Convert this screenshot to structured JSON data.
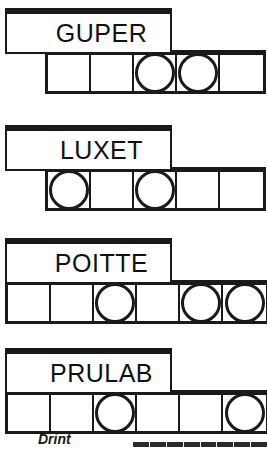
{
  "page": {
    "background_color": "#ffffff",
    "ink_color": "#1a1a1a",
    "width": 267,
    "height": 452
  },
  "puzzles": [
    {
      "id": "puzzle-guper",
      "label": "GUPER",
      "label_box": {
        "x": 5,
        "y": 8,
        "width": 167,
        "height": 46
      },
      "grid": {
        "x": 45,
        "y": 50,
        "cells": 5,
        "cell_width": 43,
        "height": 44
      },
      "circle_cells": [
        3,
        4
      ]
    },
    {
      "id": "puzzle-luxet",
      "label": "LUXET",
      "label_box": {
        "x": 5,
        "y": 125,
        "width": 167,
        "height": 46
      },
      "grid": {
        "x": 45,
        "y": 167,
        "cells": 5,
        "cell_width": 43,
        "height": 44
      },
      "circle_cells": [
        1,
        3
      ]
    },
    {
      "id": "puzzle-poitte",
      "label": "POITTE",
      "label_box": {
        "x": 5,
        "y": 238,
        "width": 167,
        "height": 46
      },
      "grid": {
        "x": 5,
        "y": 280,
        "cells": 6,
        "cell_width": 43,
        "height": 44
      },
      "circle_cells": [
        3,
        5,
        6
      ]
    },
    {
      "id": "puzzle-prulab",
      "label": "PRULAB",
      "label_box": {
        "x": 5,
        "y": 348,
        "width": 167,
        "height": 46
      },
      "grid": {
        "x": 5,
        "y": 390,
        "cells": 6,
        "cell_width": 43,
        "height": 44
      },
      "circle_cells": [
        3,
        6
      ]
    }
  ],
  "footer": {
    "word": "Drint",
    "bar_visible": true
  }
}
